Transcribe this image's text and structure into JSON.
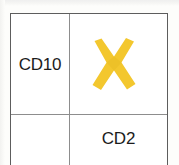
{
  "figure": {
    "type": "2x2-matrix-table",
    "rows": 2,
    "columns": 2,
    "background_color": "#fdfdfb",
    "border_color": "#5d5d5d",
    "divider_color": "#8d8d8d"
  },
  "cells": [
    {
      "row": 1,
      "column": 1,
      "label": "CD10",
      "mark": "none"
    },
    {
      "row": 1,
      "column": 2,
      "label": "",
      "mark": "x-mark"
    },
    {
      "row": 2,
      "column": 1,
      "label": "",
      "mark": "none"
    },
    {
      "row": 2,
      "column": 2,
      "label": "CD2",
      "mark": "none"
    }
  ],
  "labels": {
    "row_label": "CD10",
    "column_label": "CD2"
  },
  "mark": {
    "name": "x-mark",
    "glyph": "✖",
    "color": "#f3c72e",
    "shade_color": "#e8bc24"
  }
}
